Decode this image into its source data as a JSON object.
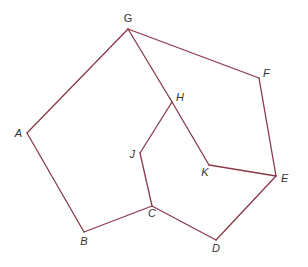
{
  "diagram": {
    "type": "graph",
    "edge_color": "#8a3a4a",
    "label_color": "#333333",
    "vertices": [
      {
        "id": "G",
        "label": "G",
        "x": 128,
        "y": 29,
        "lx": 128,
        "ly": 22,
        "anchor": "middle"
      },
      {
        "id": "F",
        "label": "F",
        "x": 259,
        "y": 78,
        "lx": 263,
        "ly": 77,
        "anchor": "start"
      },
      {
        "id": "E",
        "label": "E",
        "x": 276,
        "y": 176,
        "lx": 281,
        "ly": 182,
        "anchor": "start"
      },
      {
        "id": "D",
        "label": "D",
        "x": 216,
        "y": 240,
        "lx": 216,
        "ly": 252,
        "anchor": "middle"
      },
      {
        "id": "C",
        "label": "C",
        "x": 152,
        "y": 206,
        "lx": 152,
        "ly": 217,
        "anchor": "middle"
      },
      {
        "id": "B",
        "label": "B",
        "x": 84,
        "y": 232,
        "lx": 84,
        "ly": 245,
        "anchor": "middle"
      },
      {
        "id": "A",
        "label": "A",
        "x": 27,
        "y": 133,
        "lx": 22,
        "ly": 137,
        "anchor": "end"
      },
      {
        "id": "H",
        "label": "H",
        "x": 172,
        "y": 102,
        "lx": 176,
        "ly": 101,
        "anchor": "start"
      },
      {
        "id": "J",
        "label": "J",
        "x": 140,
        "y": 153,
        "lx": 135,
        "ly": 158,
        "anchor": "end"
      },
      {
        "id": "K",
        "label": "K",
        "x": 209,
        "y": 165,
        "lx": 205,
        "ly": 176,
        "anchor": "middle"
      }
    ],
    "edges": [
      [
        "G",
        "A"
      ],
      [
        "A",
        "B"
      ],
      [
        "B",
        "C"
      ],
      [
        "C",
        "D"
      ],
      [
        "D",
        "E"
      ],
      [
        "E",
        "F"
      ],
      [
        "F",
        "G"
      ],
      [
        "G",
        "H"
      ],
      [
        "H",
        "K"
      ],
      [
        "K",
        "E"
      ],
      [
        "H",
        "J"
      ],
      [
        "J",
        "C"
      ]
    ]
  }
}
